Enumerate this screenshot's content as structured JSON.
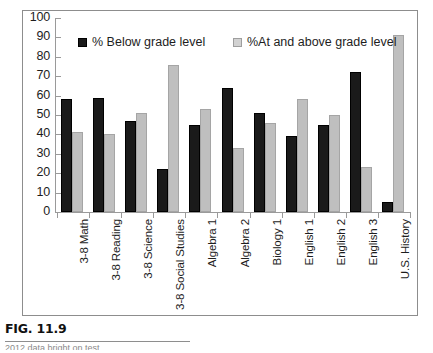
{
  "figure": {
    "caption": "FIG. 11.9",
    "footer_partial": "2012 data bright on test"
  },
  "legend": {
    "position": "inside-top",
    "items": [
      {
        "label": "% Below grade level",
        "color": "#1a1a1a",
        "swatch": "dark-square-icon"
      },
      {
        "label": "%At and above grade level",
        "color": "#d2d2d2",
        "swatch": "light-square-icon"
      }
    ]
  },
  "chart_data": {
    "type": "bar",
    "title": "",
    "subtitle": "",
    "xlabel": "",
    "ylabel": "",
    "ylim": [
      0,
      100
    ],
    "yticks": [
      0,
      10,
      20,
      30,
      40,
      50,
      60,
      70,
      80,
      90,
      100
    ],
    "ytick_labels": [
      "0",
      "10",
      "20",
      "30",
      "40",
      "50",
      "60",
      "70",
      "80",
      "90",
      "100"
    ],
    "grid": false,
    "legend_position": "inside-top",
    "categories": [
      "3-8 Math",
      "3-8 Reading",
      "3-8 Science",
      "3-8 Social Studies",
      "Algebra 1",
      "Algebra 2",
      "Biology 1",
      "English 1",
      "English 2",
      "English 3",
      "U.S. History"
    ],
    "series": [
      {
        "name": "% Below grade level",
        "color": "#1a1a1a",
        "values": [
          58,
          59,
          47,
          22,
          45,
          64,
          51,
          39,
          45,
          72,
          5
        ]
      },
      {
        "name": "%At and above grade level",
        "color": "#bfbfbf",
        "values": [
          41,
          40,
          51,
          76,
          53,
          33,
          46,
          58,
          50,
          23,
          91
        ]
      }
    ]
  }
}
